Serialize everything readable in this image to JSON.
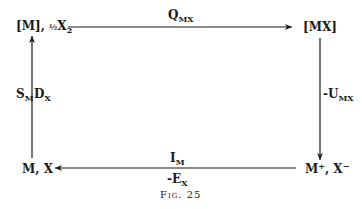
{
  "nodes": {
    "top_left": {
      "main": "[M], ",
      "frac": "½",
      "x": "X",
      "sub": "2"
    },
    "top_right": {
      "label": "[MX]"
    },
    "bottom_left": {
      "label": "M, X"
    },
    "bottom_right": {
      "main": "M",
      "sup1": "+",
      "sep": ", X",
      "sup2": "−"
    }
  },
  "edges": {
    "top": {
      "main": "Q",
      "sub": "MX"
    },
    "right": {
      "main": "-U",
      "sub": "MX"
    },
    "left": {
      "main1": "S",
      "sub1": "M",
      "main2": "D",
      "sub2": "X"
    },
    "bottom": {
      "main1": "I",
      "sub1": "M",
      "main2": "-E",
      "sub2": "X"
    }
  },
  "caption": "Fig. 25"
}
